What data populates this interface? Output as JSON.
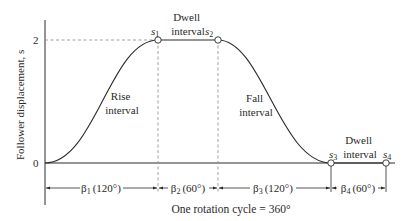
{
  "diagram": {
    "type": "cam displacement diagram",
    "y_axis": {
      "label": "Follower displacement, s",
      "ticks": [
        {
          "label": "2",
          "value": 2
        },
        {
          "label": "0",
          "value": 0
        }
      ]
    },
    "points": [
      {
        "label": "s",
        "sub": "1"
      },
      {
        "label": "s",
        "sub": "2"
      },
      {
        "label": "s",
        "sub": "3"
      },
      {
        "label": "s",
        "sub": "4"
      }
    ],
    "intervals": [
      {
        "line1": "Rise",
        "line2": "interval"
      },
      {
        "line1": "Dwell",
        "line2": "interval"
      },
      {
        "line1": "Fall",
        "line2": "interval"
      },
      {
        "line1": "Dwell",
        "line2": "interval"
      }
    ],
    "dimensions": [
      {
        "symbol": "β",
        "sub": "1",
        "angle": "(120°)"
      },
      {
        "symbol": "β",
        "sub": "2",
        "angle": "(60°)"
      },
      {
        "symbol": "β",
        "sub": "3",
        "angle": "(120°)"
      },
      {
        "symbol": "β",
        "sub": "4",
        "angle": "(60°)"
      }
    ],
    "caption": "One rotation cycle = 360°",
    "colors": {
      "line": "#2a2a2a",
      "dashed": "#888888"
    }
  }
}
